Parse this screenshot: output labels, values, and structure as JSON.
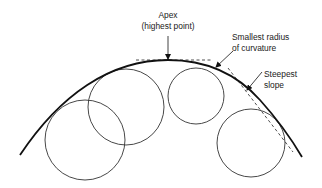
{
  "diagram": {
    "labels": {
      "apex_line1": "Apex",
      "apex_line2": "(highest point)",
      "radius_line1": "Smallest radius",
      "radius_line2": "of curvature",
      "slope_line1": "Steepest",
      "slope_line2": "slope"
    },
    "colors": {
      "stroke": "#111111",
      "circle": "#333333",
      "background": "#ffffff"
    },
    "elements": {
      "curve": "convex arch curve",
      "circles": 4,
      "tangent_lines": [
        "horizontal tangent at apex",
        "tangent at steepest slope"
      ]
    }
  }
}
